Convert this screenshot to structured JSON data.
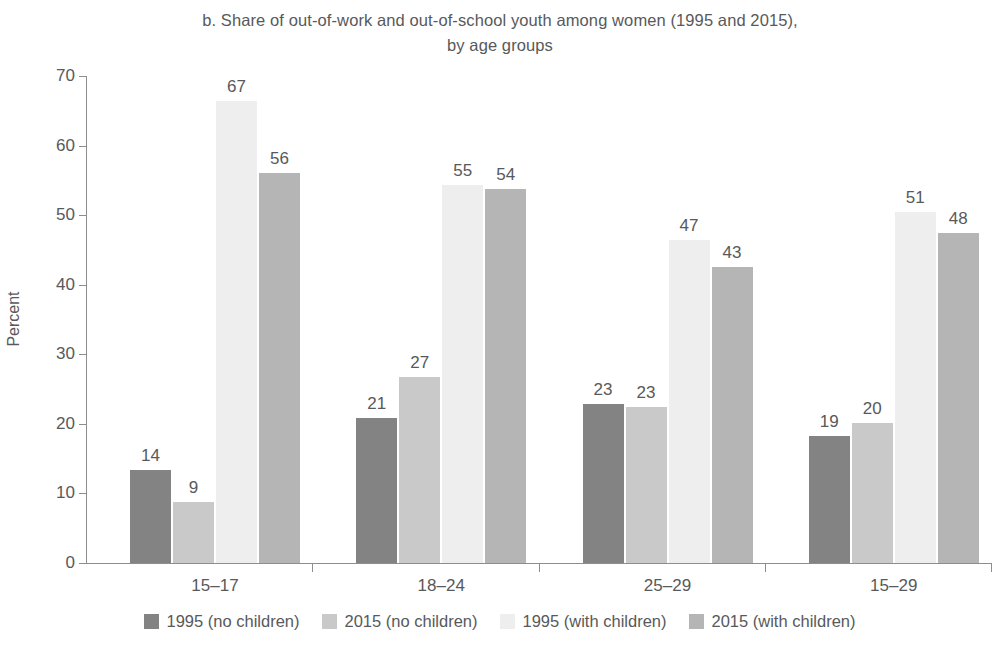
{
  "chart_data": {
    "type": "bar",
    "title": "b. Share of out-of-work and out-of-school youth among women (1995 and 2015), by age groups",
    "title_line1": "b. Share of out-of-work and out-of-school youth among women (1995 and 2015),",
    "title_line2": "by age groups",
    "xlabel": "",
    "ylabel": "Percent",
    "ylim": [
      0,
      70
    ],
    "ytick_step": 10,
    "yticks": [
      0,
      10,
      20,
      30,
      40,
      50,
      60,
      70
    ],
    "ytick_labels": [
      "0",
      "10",
      "20",
      "30",
      "40",
      "50",
      "60",
      "70"
    ],
    "grid": false,
    "legend_position": "bottom",
    "categories": [
      "15–17",
      "18–24",
      "25–29",
      "15–29"
    ],
    "series": [
      {
        "name": "1995 (no children)",
        "color": "#838383",
        "values": [
          14,
          9,
          21,
          23
        ],
        "values_plotted": [
          13.4,
          20.8,
          22.8,
          18.3
        ],
        "labels": [
          "14",
          "21",
          "23",
          "19"
        ]
      },
      {
        "name": "2015 (no children)",
        "color": "#c9c9c9",
        "values": [
          9,
          27,
          23,
          20
        ],
        "values_plotted": [
          8.7,
          26.7,
          22.4,
          20.1
        ],
        "labels": [
          "9",
          "27",
          "23",
          "20"
        ]
      },
      {
        "name": "1995 (with children)",
        "color": "#eeeeee",
        "values": [
          67,
          55,
          47,
          51
        ],
        "values_plotted": [
          66.4,
          54.4,
          46.4,
          50.4
        ],
        "labels": [
          "67",
          "55",
          "47",
          "51"
        ]
      },
      {
        "name": "2015 (with children)",
        "color": "#b5b5b5",
        "values": [
          56,
          54,
          43,
          48
        ],
        "values_plotted": [
          56.0,
          53.8,
          42.5,
          47.4
        ],
        "labels": [
          "56",
          "54",
          "43",
          "48"
        ]
      }
    ],
    "groups": [
      {
        "category": "15–17",
        "bars": [
          {
            "series": "1995 (no children)",
            "label": "14",
            "value": 14,
            "plotted": 13.4
          },
          {
            "series": "2015 (no children)",
            "label": "9",
            "value": 9,
            "plotted": 8.7
          },
          {
            "series": "1995 (with children)",
            "label": "67",
            "value": 67,
            "plotted": 66.4
          },
          {
            "series": "2015 (with children)",
            "label": "56",
            "value": 56,
            "plotted": 56.0
          }
        ]
      },
      {
        "category": "18–24",
        "bars": [
          {
            "series": "1995 (no children)",
            "label": "21",
            "value": 21,
            "plotted": 20.8
          },
          {
            "series": "2015 (no children)",
            "label": "27",
            "value": 27,
            "plotted": 26.7
          },
          {
            "series": "1995 (with children)",
            "label": "55",
            "value": 55,
            "plotted": 54.4
          },
          {
            "series": "2015 (with children)",
            "label": "54",
            "value": 54,
            "plotted": 53.8
          }
        ]
      },
      {
        "category": "25–29",
        "bars": [
          {
            "series": "1995 (no children)",
            "label": "23",
            "value": 23,
            "plotted": 22.8
          },
          {
            "series": "2015 (no children)",
            "label": "23",
            "value": 23,
            "plotted": 22.4
          },
          {
            "series": "1995 (with children)",
            "label": "47",
            "value": 47,
            "plotted": 46.4
          },
          {
            "series": "2015 (with children)",
            "label": "43",
            "value": 43,
            "plotted": 42.5
          }
        ]
      },
      {
        "category": "15–29",
        "bars": [
          {
            "series": "1995 (no children)",
            "label": "19",
            "value": 19,
            "plotted": 18.3
          },
          {
            "series": "2015 (no children)",
            "label": "20",
            "value": 20,
            "plotted": 20.1
          },
          {
            "series": "1995 (with children)",
            "label": "51",
            "value": 51,
            "plotted": 50.4
          },
          {
            "series": "2015 (with children)",
            "label": "48",
            "value": 48,
            "plotted": 47.4
          }
        ]
      }
    ]
  },
  "legend": {
    "items": [
      {
        "label": "1995 (no children)",
        "color": "#838383"
      },
      {
        "label": "2015 (no children)",
        "color": "#c9c9c9"
      },
      {
        "label": "1995 (with children)",
        "color": "#eeeeee"
      },
      {
        "label": "2015 (with children)",
        "color": "#b5b5b5"
      }
    ]
  },
  "axis": {
    "y_title": "Percent",
    "y_labels": [
      "70",
      "60",
      "50",
      "40",
      "30",
      "20",
      "10",
      "0"
    ],
    "x_labels": [
      "15–17",
      "18–24",
      "25–29",
      "15–29"
    ]
  },
  "colors": {
    "text": "#58595b",
    "axis": "#8d8d8d",
    "background": "#ffffff"
  }
}
